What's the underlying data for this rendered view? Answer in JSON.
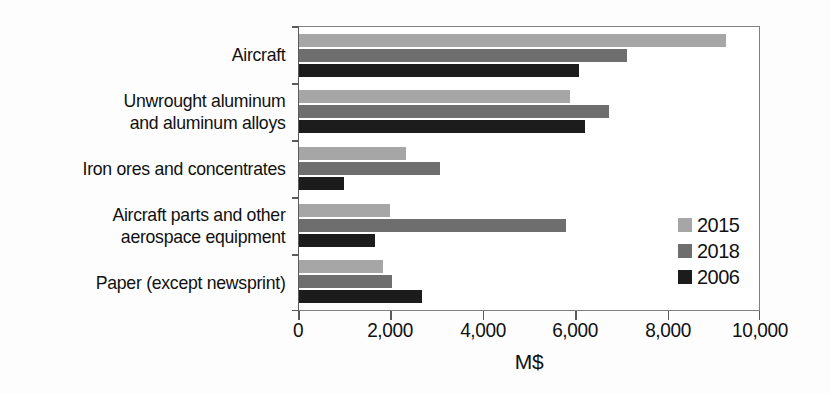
{
  "chart_data": {
    "type": "bar",
    "orientation": "horizontal",
    "title": "",
    "xlabel": "M$",
    "ylabel": "",
    "xlim": [
      0,
      10000
    ],
    "xticks": [
      0,
      2000,
      4000,
      6000,
      8000,
      10000
    ],
    "xtick_labels": [
      "0",
      "2,000",
      "4,000",
      "6,000",
      "8,000",
      "10,000"
    ],
    "grid": false,
    "legend_position": "center-right",
    "categories": [
      "Aircraft",
      "Unwrought aluminum\nand aluminum alloys",
      "Iron ores and concentrates",
      "Aircraft parts and other\naerospace equipment",
      "Paper (except newsprint)"
    ],
    "series": [
      {
        "name": "2015",
        "color": "#a6a6a6",
        "values": [
          9285,
          5890,
          2320,
          1970,
          1820
        ]
      },
      {
        "name": "2018",
        "color": "#6e6e6e",
        "values": [
          7120,
          6730,
          3070,
          5800,
          2030
        ]
      },
      {
        "name": "2006",
        "color": "#1c1c1c",
        "values": [
          6080,
          6210,
          970,
          1645,
          2680
        ]
      }
    ]
  },
  "legend": {
    "entries": [
      {
        "label": "2015",
        "color": "#a6a6a6"
      },
      {
        "label": "2018",
        "color": "#6e6e6e"
      },
      {
        "label": "2006",
        "color": "#1c1c1c"
      }
    ]
  },
  "axis": {
    "x_title": "M$",
    "tick_labels": [
      "0",
      "2,000",
      "4,000",
      "6,000",
      "8,000",
      "10,000"
    ]
  }
}
